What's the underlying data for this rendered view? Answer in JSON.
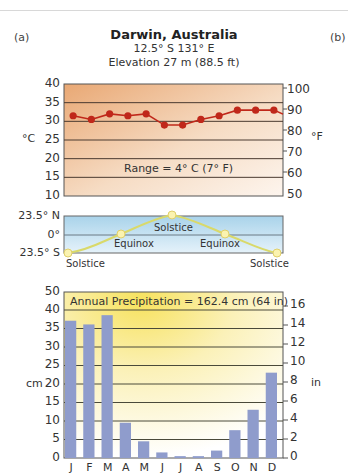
{
  "panel_labels": {
    "left": "(a)",
    "right": "(b)"
  },
  "header": {
    "title": "Darwin, Australia",
    "coords": "12.5° S  131° E",
    "elevation": "Elevation 27 m (88.5 ft)"
  },
  "temperature": {
    "unit_left": "°C",
    "unit_right": "°F",
    "ticks_c": [
      "40",
      "35",
      "30",
      "25",
      "20",
      "15",
      "10"
    ],
    "ticks_f": [
      "100",
      "90",
      "80",
      "70",
      "60",
      "50"
    ],
    "range_label": "Range = 4° C (7° F)",
    "line_color": "#c0281a"
  },
  "sun": {
    "labels_left": [
      "23.5° N",
      "0°",
      "23.5° S"
    ],
    "solstice_label": "Solstice",
    "equinox_label": "Equinox"
  },
  "precipitation": {
    "annual_label": "Annual Precipitation = 162.4 cm (64 in)",
    "unit_left": "cm",
    "unit_right": "in",
    "ticks_cm": [
      "50",
      "40",
      "35",
      "30",
      "25",
      "20",
      "15",
      "10",
      "5",
      "0"
    ],
    "ticks_in": [
      "16",
      "14",
      "12",
      "10",
      "8",
      "6",
      "4",
      "2",
      "0"
    ],
    "bar_color": "#8f9ccc",
    "months": [
      "J",
      "F",
      "M",
      "A",
      "M",
      "J",
      "J",
      "A",
      "S",
      "O",
      "N",
      "D"
    ]
  },
  "chart_data": [
    {
      "type": "line",
      "title": "Darwin, Australia — Monthly Temperature",
      "categories": [
        "J",
        "F",
        "M",
        "A",
        "M",
        "J",
        "J",
        "A",
        "S",
        "O",
        "N",
        "D"
      ],
      "series": [
        {
          "name": "Temperature (°C)",
          "values": [
            31.5,
            30.5,
            32,
            31.5,
            32,
            29,
            29,
            30.5,
            31.5,
            33,
            33,
            33
          ]
        }
      ],
      "ylabel": "°C",
      "y2label": "°F",
      "ylim": [
        10,
        40
      ],
      "y2lim": [
        50,
        104
      ],
      "annotation": "Range = 4° C (7° F)",
      "grid": true
    },
    {
      "type": "line",
      "title": "Sun position",
      "categories": [
        "Dec Solstice",
        "Equinox",
        "Jun Solstice",
        "Equinox",
        "Dec Solstice"
      ],
      "values": [
        -23.5,
        0,
        23.5,
        0,
        -23.5
      ],
      "ylabel": "Latitude",
      "tick_labels": [
        "23.5° N",
        "0°",
        "23.5° S"
      ]
    },
    {
      "type": "bar",
      "title": "Annual Precipitation = 162.4 cm (64 in)",
      "categories": [
        "J",
        "F",
        "M",
        "A",
        "M",
        "J",
        "J",
        "A",
        "S",
        "O",
        "N",
        "D"
      ],
      "values": [
        37,
        36,
        38.5,
        9.5,
        4.5,
        1.5,
        0.5,
        0.5,
        2,
        7.5,
        13,
        23
      ],
      "ylabel": "cm",
      "y2label": "in",
      "ylim": [
        0,
        45
      ],
      "y2lim": [
        0,
        17
      ],
      "grid": true
    }
  ]
}
